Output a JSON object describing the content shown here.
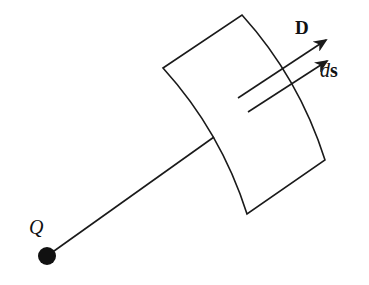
{
  "diagram": {
    "type": "electric-flux-surface",
    "labels": {
      "charge": "Q",
      "field_vector": "D",
      "area_vector_d": "d",
      "area_vector_s": "s"
    },
    "colors": {
      "stroke": "#1a1a1a",
      "charge_fill": "#111111",
      "background": "#ffffff"
    },
    "elements": {
      "charge_point": {
        "x": 47,
        "y": 256,
        "r": 9
      },
      "radial_line": {
        "from": [
          47,
          256
        ],
        "to": [
          214,
          137
        ]
      },
      "surface_corners": {
        "top_left": [
          163,
          68
        ],
        "top_right": [
          242,
          15
        ],
        "bottom_right": [
          325,
          160
        ],
        "bottom_left": [
          247,
          214
        ]
      },
      "vector_D": {
        "from": [
          238,
          98
        ],
        "to": [
          326,
          40
        ]
      },
      "vector_ds": {
        "from": [
          248,
          112
        ],
        "to": [
          327,
          61
        ]
      }
    }
  }
}
